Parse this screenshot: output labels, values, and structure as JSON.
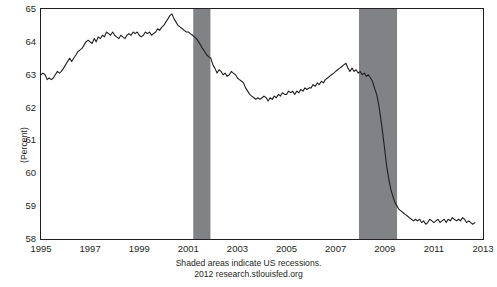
{
  "chart_data": {
    "type": "line",
    "title": "",
    "xlabel": "",
    "ylabel": "(Percent)",
    "xlim": [
      1995.0,
      2013.0
    ],
    "ylim": [
      58,
      65
    ],
    "yticks": [
      "58",
      "59",
      "60",
      "61",
      "62",
      "63",
      "64",
      "65"
    ],
    "xticks": [
      "1995",
      "1997",
      "1999",
      "2001",
      "2003",
      "2005",
      "2007",
      "2009",
      "2011",
      "2013"
    ],
    "grid": false,
    "legend_position": "none",
    "line_color": "#231f20",
    "recession_band_color": "#808285",
    "recessions": [
      {
        "start": 2001.2,
        "end": 2001.9
      },
      {
        "start": 2007.95,
        "end": 2009.5
      }
    ],
    "series": [
      {
        "name": "Civilian Labor Force Participation Rate",
        "x": [
          1995.0,
          1995.08,
          1995.17,
          1995.25,
          1995.33,
          1995.42,
          1995.5,
          1995.58,
          1995.67,
          1995.75,
          1995.83,
          1995.92,
          1996.0,
          1996.08,
          1996.17,
          1996.25,
          1996.33,
          1996.42,
          1996.5,
          1996.58,
          1996.67,
          1996.75,
          1996.83,
          1996.92,
          1997.0,
          1997.08,
          1997.17,
          1997.25,
          1997.33,
          1997.42,
          1997.5,
          1997.58,
          1997.67,
          1997.75,
          1997.83,
          1997.92,
          1998.0,
          1998.08,
          1998.17,
          1998.25,
          1998.33,
          1998.42,
          1998.5,
          1998.58,
          1998.67,
          1998.75,
          1998.83,
          1998.92,
          1999.0,
          1999.08,
          1999.17,
          1999.25,
          1999.33,
          1999.42,
          1999.5,
          1999.58,
          1999.67,
          1999.75,
          1999.83,
          1999.92,
          2000.0,
          2000.08,
          2000.17,
          2000.25,
          2000.33,
          2000.42,
          2000.5,
          2000.58,
          2000.67,
          2000.75,
          2000.83,
          2000.92,
          2001.0,
          2001.08,
          2001.17,
          2001.25,
          2001.33,
          2001.42,
          2001.5,
          2001.58,
          2001.67,
          2001.75,
          2001.83,
          2001.92,
          2002.0,
          2002.08,
          2002.17,
          2002.25,
          2002.33,
          2002.42,
          2002.5,
          2002.58,
          2002.67,
          2002.75,
          2002.83,
          2002.92,
          2003.0,
          2003.08,
          2003.17,
          2003.25,
          2003.33,
          2003.42,
          2003.5,
          2003.58,
          2003.67,
          2003.75,
          2003.83,
          2003.92,
          2004.0,
          2004.08,
          2004.17,
          2004.25,
          2004.33,
          2004.42,
          2004.5,
          2004.58,
          2004.67,
          2004.75,
          2004.83,
          2004.92,
          2005.0,
          2005.08,
          2005.17,
          2005.25,
          2005.33,
          2005.42,
          2005.5,
          2005.58,
          2005.67,
          2005.75,
          2005.83,
          2005.92,
          2006.0,
          2006.08,
          2006.17,
          2006.25,
          2006.33,
          2006.42,
          2006.5,
          2006.58,
          2006.67,
          2006.75,
          2006.83,
          2006.92,
          2007.0,
          2007.08,
          2007.17,
          2007.25,
          2007.33,
          2007.42,
          2007.5,
          2007.58,
          2007.67,
          2007.75,
          2007.83,
          2007.92,
          2008.0,
          2008.08,
          2008.17,
          2008.25,
          2008.33,
          2008.42,
          2008.5,
          2008.58,
          2008.67,
          2008.75,
          2008.83,
          2008.92,
          2009.0,
          2009.08,
          2009.17,
          2009.25,
          2009.33,
          2009.42,
          2009.5,
          2009.58,
          2009.67,
          2009.75,
          2009.83,
          2009.92,
          2010.0,
          2010.08,
          2010.17,
          2010.25,
          2010.33,
          2010.42,
          2010.5,
          2010.58,
          2010.67,
          2010.75,
          2010.83,
          2010.92,
          2011.0,
          2011.08,
          2011.17,
          2011.25,
          2011.33,
          2011.42,
          2011.5,
          2011.58,
          2011.67,
          2011.75,
          2011.83,
          2011.92,
          2012.0,
          2012.08,
          2012.17,
          2012.25,
          2012.33,
          2012.42,
          2012.5,
          2012.58,
          2012.67
        ],
        "values": [
          63.0,
          63.05,
          63.0,
          62.85,
          62.9,
          62.85,
          62.9,
          63.0,
          63.1,
          63.05,
          63.1,
          63.2,
          63.3,
          63.4,
          63.5,
          63.4,
          63.5,
          63.6,
          63.7,
          63.75,
          63.8,
          63.9,
          64.0,
          64.05,
          64.0,
          63.95,
          64.1,
          64.0,
          64.15,
          64.1,
          64.2,
          64.15,
          64.3,
          64.25,
          64.2,
          64.3,
          64.2,
          64.15,
          64.1,
          64.2,
          64.15,
          64.1,
          64.2,
          64.25,
          64.2,
          64.3,
          64.25,
          64.3,
          64.2,
          64.15,
          64.2,
          64.3,
          64.25,
          64.3,
          64.2,
          64.25,
          64.3,
          64.4,
          64.35,
          64.45,
          64.5,
          64.6,
          64.7,
          64.8,
          64.85,
          64.7,
          64.6,
          64.5,
          64.45,
          64.4,
          64.35,
          64.3,
          64.3,
          64.25,
          64.2,
          64.15,
          64.1,
          64.0,
          63.9,
          63.8,
          63.7,
          63.6,
          63.55,
          63.5,
          63.3,
          63.2,
          63.05,
          63.15,
          63.1,
          63.0,
          63.05,
          62.95,
          63.0,
          63.1,
          63.05,
          63.0,
          62.9,
          62.85,
          62.8,
          62.75,
          62.6,
          62.5,
          62.4,
          62.35,
          62.3,
          62.25,
          62.3,
          62.25,
          62.3,
          62.35,
          62.3,
          62.2,
          62.3,
          62.25,
          62.35,
          62.3,
          62.4,
          62.35,
          62.45,
          62.4,
          62.4,
          62.5,
          62.45,
          62.5,
          62.4,
          62.5,
          62.45,
          62.55,
          62.5,
          62.6,
          62.55,
          62.6,
          62.6,
          62.7,
          62.65,
          62.75,
          62.7,
          62.8,
          62.75,
          62.85,
          62.9,
          62.95,
          63.0,
          63.05,
          63.1,
          63.15,
          63.2,
          63.25,
          63.3,
          63.35,
          63.2,
          63.1,
          63.2,
          63.1,
          63.15,
          63.05,
          63.1,
          63.0,
          63.05,
          62.95,
          63.0,
          62.9,
          62.8,
          62.6,
          62.4,
          62.1,
          61.7,
          61.2,
          60.7,
          60.2,
          59.8,
          59.5,
          59.3,
          59.1,
          59.0,
          58.9,
          58.85,
          58.8,
          58.75,
          58.7,
          58.65,
          58.6,
          58.55,
          58.6,
          58.55,
          58.6,
          58.5,
          58.55,
          58.45,
          58.5,
          58.6,
          58.55,
          58.5,
          58.55,
          58.6,
          58.5,
          58.55,
          58.6,
          58.5,
          58.6,
          58.55,
          58.65,
          58.6,
          58.55,
          58.6,
          58.55,
          58.65,
          58.6,
          58.5,
          58.55,
          58.5,
          58.45,
          58.5
        ]
      }
    ]
  },
  "caption": {
    "line1": "Shaded areas indicate US recessions.",
    "line2": "2012 research.stlouisfed.org"
  }
}
